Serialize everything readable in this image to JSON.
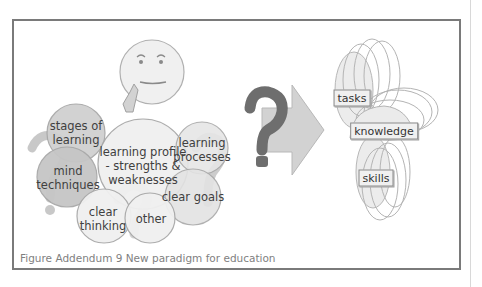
{
  "figure": {
    "caption": "Figure Addendum 9  New paradigm for education",
    "colors": {
      "frame": "#7a7a7a",
      "bubble_light": "#f0f0f0",
      "bubble_dark": "#c8c8c8",
      "bubble_stroke": "#a8a8a8",
      "question_mark": "#6e6e6e",
      "arrow": "#cfcfcf"
    }
  },
  "left_cluster": {
    "bubbles": [
      {
        "id": "stages",
        "line1": "stages of",
        "line2": "learning"
      },
      {
        "id": "mind",
        "line1": "mind",
        "line2": "techniques"
      },
      {
        "id": "profile",
        "line1": "learning profile",
        "line2": "- strengths &",
        "line3": "weaknesses"
      },
      {
        "id": "processes",
        "line1": "learning",
        "line2": "processes"
      },
      {
        "id": "goals",
        "line1": "clear goals"
      },
      {
        "id": "thinking",
        "line1": "clear",
        "line2": "thinking"
      },
      {
        "id": "other",
        "line1": "other"
      }
    ]
  },
  "right_cluster": {
    "labels": {
      "tasks": "tasks",
      "knowledge": "knowledge",
      "skills": "skills"
    }
  }
}
